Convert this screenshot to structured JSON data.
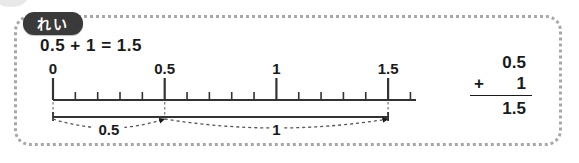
{
  "card": {
    "badge_label": "れい",
    "equation": "0.5 + 1 = 1.5"
  },
  "vertical_sum": {
    "addend_1": "0.5",
    "operator": "+",
    "addend_2": "1",
    "total": "1.5"
  },
  "numberline": {
    "axis_min": 0,
    "axis_max": 1.6,
    "minor_step": 0.1,
    "major_ticks": [
      {
        "value": 0,
        "label": "0"
      },
      {
        "value": 0.5,
        "label": "0.5"
      },
      {
        "value": 1,
        "label": "1"
      },
      {
        "value": 1.5,
        "label": "1.5"
      }
    ],
    "minor_ticks": [
      0.1,
      0.2,
      0.3,
      0.4,
      0.6,
      0.7,
      0.8,
      0.9,
      1.1,
      1.2,
      1.3,
      1.4,
      1.6
    ],
    "guide_lines": [
      0,
      0.5,
      1.5
    ],
    "span_bar": {
      "from": 0,
      "to": 1.5
    },
    "arcs": [
      {
        "from": 0,
        "to": 0.5,
        "label": "0.5"
      },
      {
        "from": 0.5,
        "to": 1.5,
        "label": "1"
      }
    ]
  },
  "colors": {
    "ink": "#1a1a1a",
    "frame": "#a8a8a8",
    "badge_bg": "#3a3a3a",
    "badge_text": "#ffffff",
    "axis": "#333333",
    "guide": "#888888"
  }
}
